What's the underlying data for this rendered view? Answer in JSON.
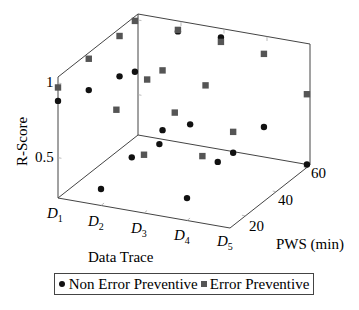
{
  "chart_data": {
    "type": "scatter3d",
    "title": "",
    "xlabel": "Data Trace",
    "ylabel": "PWS (min)",
    "zlabel": "R-Score",
    "x_ticks": [
      "D1",
      "D2",
      "D3",
      "D4",
      "D5"
    ],
    "y_ticks": [
      20,
      40,
      60
    ],
    "z_ticks": [
      0.5,
      1
    ],
    "xlim": [
      1,
      5
    ],
    "ylim": [
      10,
      62
    ],
    "zlim": [
      0.23,
      1.04
    ],
    "grid": true,
    "legend_position": "bottom",
    "series": [
      {
        "name": "Non Error Preventive",
        "marker": "circle",
        "color": "#111111",
        "points": [
          {
            "x": 1,
            "y": 10,
            "z": 0.88
          },
          {
            "x": 1,
            "y": 30,
            "z": 0.79
          },
          {
            "x": 1,
            "y": 50,
            "z": 0.72
          },
          {
            "x": 1,
            "y": 60,
            "z": 0.67
          },
          {
            "x": 2,
            "y": 10,
            "z": 0.34
          },
          {
            "x": 2,
            "y": 30,
            "z": 0.39
          },
          {
            "x": 2,
            "y": 50,
            "z": 0.41
          },
          {
            "x": 2,
            "y": 60,
            "z": 0.99
          },
          {
            "x": 3,
            "y": 20,
            "z": 0.61
          },
          {
            "x": 3,
            "y": 40,
            "z": 0.58
          },
          {
            "x": 3,
            "y": 60,
            "z": 1.0
          },
          {
            "x": 4,
            "y": 10,
            "z": 0.38
          },
          {
            "x": 4,
            "y": 30,
            "z": 0.46
          },
          {
            "x": 4,
            "y": 40,
            "z": 0.44
          },
          {
            "x": 4,
            "y": 60,
            "z": 0.45
          },
          {
            "x": 5,
            "y": 60,
            "z": 0.25
          }
        ]
      },
      {
        "name": "Error Preventive",
        "marker": "square",
        "color": "#555555",
        "points": [
          {
            "x": 1,
            "y": 10,
            "z": 0.97
          },
          {
            "x": 1,
            "y": 30,
            "z": 1.0
          },
          {
            "x": 1,
            "y": 50,
            "z": 0.99
          },
          {
            "x": 1,
            "y": 60,
            "z": 1.01
          },
          {
            "x": 2,
            "y": 20,
            "z": 0.79
          },
          {
            "x": 2,
            "y": 40,
            "z": 0.83
          },
          {
            "x": 2,
            "y": 50,
            "z": 0.81
          },
          {
            "x": 2,
            "y": 60,
            "z": 1.0
          },
          {
            "x": 3,
            "y": 10,
            "z": 0.62
          },
          {
            "x": 3,
            "y": 30,
            "z": 0.74
          },
          {
            "x": 3,
            "y": 50,
            "z": 0.76
          },
          {
            "x": 3,
            "y": 60,
            "z": 0.97
          },
          {
            "x": 4,
            "y": 20,
            "z": 0.58
          },
          {
            "x": 4,
            "y": 40,
            "z": 0.58
          },
          {
            "x": 4,
            "y": 60,
            "z": 0.94
          },
          {
            "x": 5,
            "y": 60,
            "z": 0.72
          }
        ]
      }
    ]
  },
  "labels": {
    "zlabel": "R-Score",
    "xlabel": "Data Trace",
    "ylabel": "PWS (min)",
    "z_tick_1": "1",
    "z_tick_05": "0.5",
    "y_tick_20": "20",
    "y_tick_40": "40",
    "y_tick_60": "60"
  },
  "legend": {
    "item1": "Non Error Preventive",
    "item2": "Error Preventive"
  }
}
